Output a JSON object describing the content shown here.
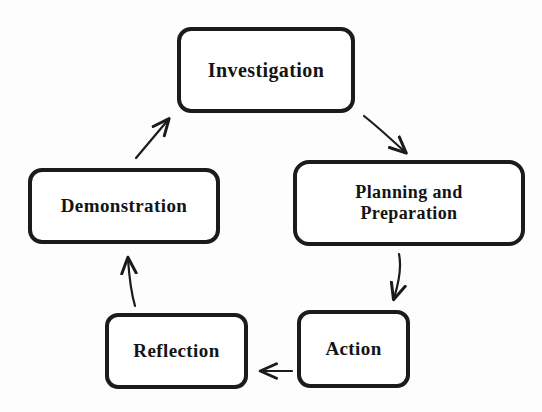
{
  "diagram": {
    "type": "cycle-flowchart",
    "stroke_color": "#1b1b1b",
    "fill_color": "#ffffff",
    "text_color": "#141414",
    "nodes": [
      {
        "id": "investigation",
        "label": "Investigation",
        "icon": "rounded-rectangle-node"
      },
      {
        "id": "planning",
        "label": "Planning and\nPreparation",
        "icon": "rounded-rectangle-node"
      },
      {
        "id": "action",
        "label": "Action",
        "icon": "rounded-rectangle-node"
      },
      {
        "id": "reflection",
        "label": "Reflection",
        "icon": "rounded-rectangle-node"
      },
      {
        "id": "demonstration",
        "label": "Demonstration",
        "icon": "rounded-rectangle-node"
      }
    ],
    "edges": [
      {
        "id": "investigation-to-planning",
        "from": "Investigation",
        "to": "Planning and Preparation",
        "direction": "down-right",
        "icon": "arrow-icon"
      },
      {
        "id": "planning-to-action",
        "from": "Planning and Preparation",
        "to": "Action",
        "direction": "down",
        "icon": "arrow-icon"
      },
      {
        "id": "action-to-reflection",
        "from": "Action",
        "to": "Reflection",
        "direction": "left",
        "icon": "arrow-icon"
      },
      {
        "id": "reflection-to-demonstration",
        "from": "Reflection",
        "to": "Demonstration",
        "direction": "up",
        "icon": "arrow-icon"
      },
      {
        "id": "demonstration-to-investigation",
        "from": "Demonstration",
        "to": "Investigation",
        "direction": "up-right",
        "icon": "arrow-icon"
      }
    ]
  }
}
